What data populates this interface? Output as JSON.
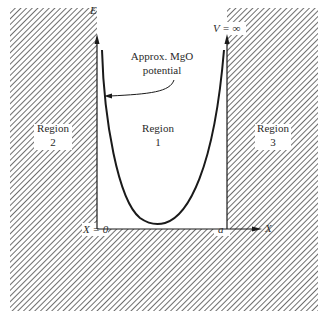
{
  "diagram": {
    "axes": {
      "y_label": "E",
      "x_label": "X",
      "origin_label": "X = 0",
      "right_wall_label": "a",
      "wall_potential_label": "V = ∞"
    },
    "annotation": {
      "line1": "Approx. MgO",
      "line2": "potential"
    },
    "regions": [
      {
        "name": "Region",
        "number": "1",
        "location": "inside well"
      },
      {
        "name": "Region",
        "number": "2",
        "location": "left hatched wall"
      },
      {
        "name": "Region",
        "number": "3",
        "location": "right hatched wall"
      }
    ],
    "colors": {
      "ink": "#1a1a1a",
      "hatch": "#555555",
      "background": "#ffffff"
    }
  }
}
